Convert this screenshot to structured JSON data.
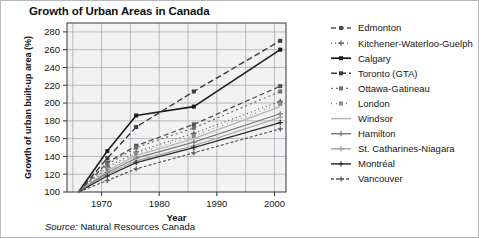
{
  "chart_data": {
    "type": "line",
    "title": "Growth of Urban Areas in Canada",
    "xlabel": "Year",
    "ylabel": "Growth of urban built-up area (%)",
    "xlim": [
      1964,
      2002
    ],
    "ylim": [
      100,
      290
    ],
    "xticks": [
      1970,
      1980,
      1990,
      2000
    ],
    "yticks": [
      100,
      120,
      140,
      160,
      180,
      200,
      220,
      240,
      260,
      280
    ],
    "grid": true,
    "legend_position": "right",
    "source": "Natural Resources Canada",
    "source_prefix": "Source:",
    "x": [
      1966,
      1971,
      1976,
      1986,
      2001
    ],
    "series": [
      {
        "name": "Edmonton",
        "color": "#4d4d4d",
        "dash": "5,3",
        "marker": "square",
        "width": 1.3,
        "values": [
          100,
          133,
          152,
          176,
          219
        ]
      },
      {
        "name": "Kitchener-Waterloo-Guelph",
        "color": "#555555",
        "dash": "1,3",
        "marker": "plus",
        "width": 1.2,
        "values": [
          100,
          128,
          145,
          166,
          202
        ]
      },
      {
        "name": "Calgary",
        "color": "#1c1c1c",
        "dash": "none",
        "marker": "square",
        "width": 1.6,
        "values": [
          100,
          146,
          186,
          196,
          260
        ]
      },
      {
        "name": "Toronto (GTA)",
        "color": "#3a3a3a",
        "dash": "6,3",
        "marker": "square",
        "width": 1.4,
        "values": [
          100,
          138,
          173,
          213,
          270
        ]
      },
      {
        "name": "Ottawa-Gatineau",
        "color": "#6e6e6e",
        "dash": "2,3",
        "marker": "square",
        "width": 1.2,
        "values": [
          100,
          131,
          150,
          172,
          213
        ]
      },
      {
        "name": "London",
        "color": "#8a8a8a",
        "dash": "1,4",
        "marker": "square",
        "width": 1.1,
        "values": [
          100,
          126,
          143,
          163,
          199
        ]
      },
      {
        "name": "Windsor",
        "color": "#b4b4b4",
        "dash": "none",
        "marker": "none",
        "width": 1.3,
        "values": [
          100,
          124,
          141,
          160,
          196
        ]
      },
      {
        "name": "Hamilton",
        "color": "#7a7a7a",
        "dash": "none",
        "marker": "plus",
        "width": 1.2,
        "values": [
          100,
          122,
          138,
          156,
          188
        ]
      },
      {
        "name": "St. Catharines-Niagara",
        "color": "#9e9e9e",
        "dash": "none",
        "marker": "plus",
        "width": 1.1,
        "values": [
          100,
          120,
          135,
          152,
          184
        ]
      },
      {
        "name": "Montréal",
        "color": "#2e2e2e",
        "dash": "none",
        "marker": "plus",
        "width": 1.3,
        "values": [
          100,
          118,
          133,
          150,
          178
        ]
      },
      {
        "name": "Vancouver",
        "color": "#585858",
        "dash": "3,2",
        "marker": "plus",
        "width": 1.2,
        "values": [
          100,
          113,
          126,
          144,
          171
        ]
      }
    ]
  },
  "legend": {
    "items": [
      "Edmonton",
      "Kitchener-Waterloo-Guelph",
      "Calgary",
      "Toronto (GTA)",
      "Ottawa-Gatineau",
      "London",
      "Windsor",
      "Hamilton",
      "St. Catharines-Niagara",
      "Montréal",
      "Vancouver"
    ]
  },
  "colors": {
    "plot_background": "#f2f2f2",
    "grid": "#9aa3ad",
    "frame": "#4a4a4a",
    "page_border": "#b9b9b9"
  }
}
